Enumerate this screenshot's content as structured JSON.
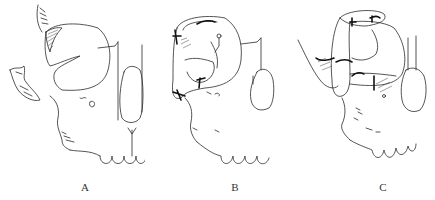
{
  "figure": {
    "panels": [
      {
        "id": "A",
        "label": "A",
        "description": "Skull lateral view with shaded flap over orbit region"
      },
      {
        "id": "B",
        "label": "B",
        "description": "Flap rotated and sutured over orbit"
      },
      {
        "id": "C",
        "label": "C",
        "description": "Tubed pedicle flap transferred over orbit with sutures"
      }
    ]
  }
}
